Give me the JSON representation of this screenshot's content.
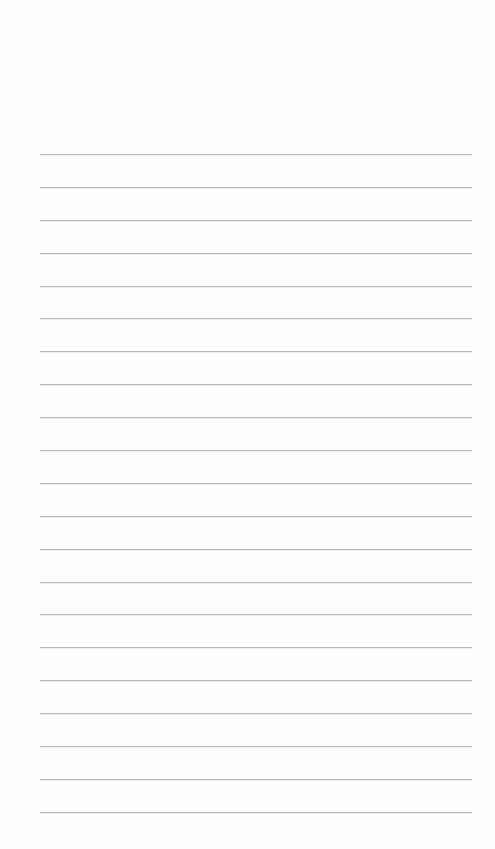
{
  "page": {
    "type": "blank lined sheet",
    "background_color": "#fefefe",
    "line_color": "#b9b9b9",
    "line_count": 21,
    "line_spacing_px": 33,
    "first_line_y": 155,
    "last_line_y": 813,
    "margin_left_px": 40,
    "margin_right_px": 23
  }
}
